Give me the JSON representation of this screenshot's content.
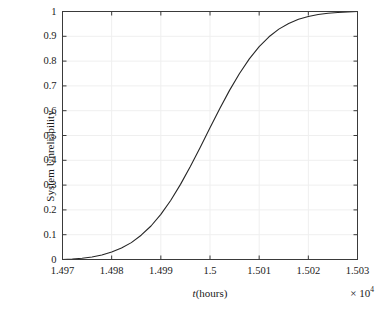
{
  "chart_data": {
    "type": "line",
    "title": "",
    "xlabel": "t(hours)",
    "ylabel": "System Unreliability",
    "x_multiplier": "× 10",
    "x_multiplier_exponent": "4",
    "xlim": [
      1.497,
      1.503
    ],
    "ylim": [
      0,
      1
    ],
    "grid": true,
    "legend": null,
    "x_tick_labels": [
      "1.497",
      "1.498",
      "1.499",
      "1.5",
      "1.501",
      "1.502",
      "1.503"
    ],
    "x_ticks": [
      1.497,
      1.498,
      1.499,
      1.5,
      1.501,
      1.502,
      1.503
    ],
    "y_tick_labels": [
      "0",
      "0.1",
      "0.2",
      "0.3",
      "0.4",
      "0.5",
      "0.6",
      "0.7",
      "0.8",
      "0.9",
      "1"
    ],
    "y_ticks": [
      0,
      0.1,
      0.2,
      0.3,
      0.4,
      0.5,
      0.6,
      0.7,
      0.8,
      0.9,
      1
    ],
    "series": [
      {
        "name": "System Unreliability",
        "color": "#262626",
        "line_width": 1.1,
        "x": [
          1.497,
          1.4972,
          1.4974,
          1.4976,
          1.4978,
          1.498,
          1.4982,
          1.4984,
          1.4986,
          1.4988,
          1.499,
          1.4992,
          1.4994,
          1.4996,
          1.4998,
          1.5,
          1.5002,
          1.5004,
          1.5006,
          1.5008,
          1.501,
          1.5012,
          1.5014,
          1.5016,
          1.5018,
          1.502,
          1.5022,
          1.5024,
          1.5026,
          1.5028,
          1.503
        ],
        "y": [
          0.0,
          0.002,
          0.005,
          0.01,
          0.018,
          0.03,
          0.046,
          0.068,
          0.098,
          0.135,
          0.182,
          0.238,
          0.303,
          0.375,
          0.452,
          0.531,
          0.609,
          0.683,
          0.75,
          0.809,
          0.858,
          0.898,
          0.929,
          0.952,
          0.969,
          0.98,
          0.988,
          0.993,
          0.996,
          0.998,
          1.0
        ]
      }
    ],
    "axes_color": "#3a3a3a",
    "grid_color": "#efefef",
    "background": "#ffffff"
  },
  "figure": {
    "ylabel_text": "System Unreliability",
    "xlabel_var": "t",
    "xlabel_rest": "(hours)",
    "exponent_prefix": "× 10",
    "exponent_power": "4"
  }
}
